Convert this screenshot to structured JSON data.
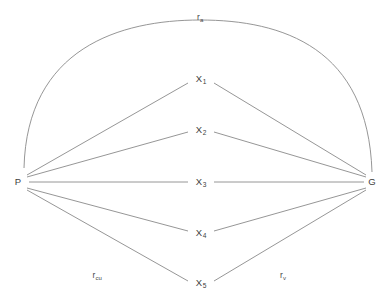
{
  "figure": {
    "type": "path-diagram",
    "background_color": "#ffffff",
    "line_color": "#8a8a8a",
    "text_color": "#3d3d3d"
  },
  "nodes": {
    "left": {
      "id": "P",
      "label": "P",
      "x": 18,
      "y": 182
    },
    "right": {
      "id": "G",
      "label": "G",
      "x": 372,
      "y": 182
    },
    "middle": [
      {
        "id": "X1",
        "base": "X",
        "sub": "1",
        "x": 201,
        "y": 79
      },
      {
        "id": "X2",
        "base": "X",
        "sub": "2",
        "x": 201,
        "y": 130
      },
      {
        "id": "X3",
        "base": "X",
        "sub": "3",
        "x": 201,
        "y": 182
      },
      {
        "id": "X4",
        "base": "X",
        "sub": "4",
        "x": 201,
        "y": 233
      },
      {
        "id": "X5",
        "base": "X",
        "sub": "5",
        "x": 201,
        "y": 283
      }
    ]
  },
  "edge_labels": [
    {
      "id": "r-a",
      "base": "r",
      "sub": "a",
      "x": 200,
      "y": 17,
      "position": "top-arc"
    },
    {
      "id": "r-cu",
      "base": "r",
      "sub": "cu",
      "x": 97,
      "y": 275,
      "position": "bottom-left"
    },
    {
      "id": "r-v",
      "base": "r",
      "sub": "v",
      "x": 283,
      "y": 275,
      "position": "bottom-right"
    }
  ],
  "edges": {
    "arc": {
      "from": "P",
      "to": "G",
      "label": "r-a",
      "style": "curved"
    },
    "straight": [
      {
        "from": "P",
        "to": "X1"
      },
      {
        "from": "P",
        "to": "X2"
      },
      {
        "from": "P",
        "to": "X3"
      },
      {
        "from": "P",
        "to": "X4"
      },
      {
        "from": "P",
        "to": "X5"
      },
      {
        "from": "X1",
        "to": "G"
      },
      {
        "from": "X2",
        "to": "G"
      },
      {
        "from": "X3",
        "to": "G"
      },
      {
        "from": "X4",
        "to": "G"
      },
      {
        "from": "X5",
        "to": "G"
      }
    ]
  }
}
